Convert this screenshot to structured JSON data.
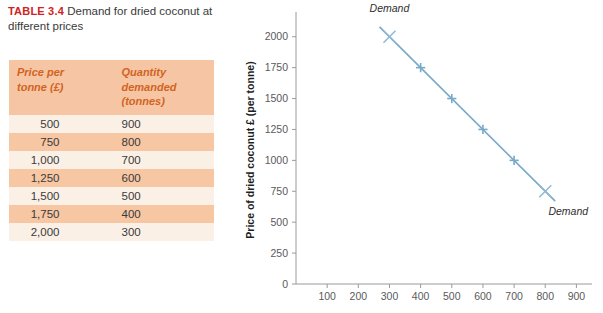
{
  "table": {
    "caption_label": "TABLE 3.4",
    "caption_text": "Demand for dried coconut at different prices",
    "headers": [
      "Price per tonne (£)",
      "Quantity demanded (tonnes)"
    ],
    "header_price_line1": "Price per",
    "header_price_line2": "tonne (£)",
    "header_qty_line1": "Quantity",
    "header_qty_line2": "demanded",
    "header_qty_line3": "(tonnes)",
    "rows": [
      {
        "price": "500",
        "quantity": "900"
      },
      {
        "price": "750",
        "quantity": "800"
      },
      {
        "price": "1,000",
        "quantity": "700"
      },
      {
        "price": "1,250",
        "quantity": "600"
      },
      {
        "price": "1,500",
        "quantity": "500"
      },
      {
        "price": "1,750",
        "quantity": "400"
      },
      {
        "price": "2,000",
        "quantity": "300"
      }
    ],
    "header_bg": "#f6c6a4",
    "header_text_color": "#d2631f",
    "row_odd_bg": "#fbf0e6",
    "row_even_bg": "#f7c6a3",
    "caption_label_color": "#cf2222"
  },
  "chart_data": {
    "type": "line",
    "title": "",
    "xlabel": "",
    "ylabel": "Price of dried coconut £ (per tonne)",
    "x": [
      300,
      400,
      500,
      600,
      700,
      800
    ],
    "series": [
      {
        "name": "Demand",
        "x": [
          300,
          400,
          500,
          600,
          700,
          800
        ],
        "values": [
          2000,
          1750,
          1500,
          1250,
          1000,
          750
        ]
      }
    ],
    "points": [
      {
        "x": 300,
        "y": 2000
      },
      {
        "x": 400,
        "y": 1750
      },
      {
        "x": 500,
        "y": 1500
      },
      {
        "x": 600,
        "y": 1250
      },
      {
        "x": 700,
        "y": 1000
      },
      {
        "x": 800,
        "y": 750
      }
    ],
    "xticks": [
      100,
      200,
      300,
      400,
      500,
      600,
      700,
      800,
      900
    ],
    "xtick_labels": [
      "100",
      "200",
      "300",
      "400",
      "500",
      "600",
      "700",
      "800",
      "900"
    ],
    "yticks": [
      0,
      250,
      500,
      750,
      1000,
      1250,
      1500,
      1750,
      2000
    ],
    "ytick_labels": [
      "0",
      "250",
      "500",
      "750",
      "1000",
      "1250",
      "1500",
      "1750",
      "2000"
    ],
    "xlim": [
      0,
      950
    ],
    "ylim": [
      0,
      2200
    ],
    "grid": false,
    "legend_position": "none",
    "annotations": [
      {
        "text": "Demand",
        "x": 300,
        "y": 2200
      },
      {
        "text": "Demand",
        "x": 810,
        "y": 560
      }
    ],
    "line_color": "#77a9c8",
    "marker": "cross",
    "axis_color": "#9a9a9a"
  }
}
